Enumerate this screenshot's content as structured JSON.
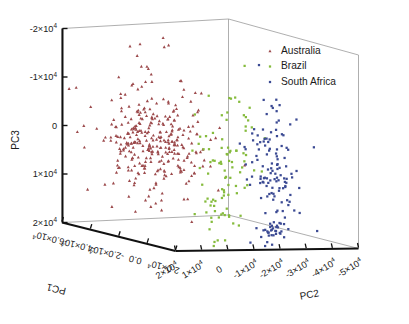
{
  "figure": {
    "kind": "3d-scatter",
    "background": "#ffffff",
    "box_line_color": "#9a9a9a",
    "axis_line_color": "#111111"
  },
  "legend": {
    "position": "top-right",
    "entries": [
      {
        "label": "Australia",
        "color": "#9c4a4c",
        "marker": "triangle"
      },
      {
        "label": "Brazil",
        "color": "#85bb3c",
        "marker": "square"
      },
      {
        "label": "South Africa",
        "color": "#3b4a93",
        "marker": "square"
      }
    ]
  },
  "axes": {
    "pc1": {
      "label": "PC1",
      "ticks": [
        "-6.0×10",
        "-4.0×10",
        "-2.0×10",
        "0.0",
        "2.0×10"
      ],
      "exponents": [
        "4",
        "4",
        "4",
        "",
        "4"
      ],
      "values": [
        -60000,
        -40000,
        -20000,
        0,
        20000
      ],
      "range": [
        -60000,
        20000
      ]
    },
    "pc2": {
      "label": "PC2",
      "ticks": [
        "2×10",
        "1×10",
        "0",
        "-1×10",
        "-2×10",
        "-3×10",
        "-4×10",
        "-5×10"
      ],
      "exponents": [
        "4",
        "4",
        "",
        "4",
        "4",
        "4",
        "4",
        "4"
      ],
      "values": [
        20000,
        10000,
        0,
        -10000,
        -20000,
        -30000,
        -40000,
        -50000
      ],
      "range": [
        20000,
        -50000
      ]
    },
    "pc3": {
      "label": "PC3",
      "ticks": [
        "-2×10",
        "-1×10",
        "0",
        "1×10",
        "2×10"
      ],
      "exponents": [
        "4",
        "4",
        "",
        "4",
        "4"
      ],
      "values": [
        -20000,
        -10000,
        0,
        10000,
        20000
      ],
      "range": [
        -20000,
        20000
      ]
    }
  },
  "chart_data": {
    "type": "scatter",
    "title": "",
    "xlabel": "PC1",
    "ylabel": "PC2",
    "zlabel": "PC3",
    "grid": false,
    "legend_position": "top-right",
    "xlim": [
      -60000,
      20000
    ],
    "ylim": [
      20000,
      -50000
    ],
    "zlim": [
      -20000,
      20000
    ],
    "series": [
      {
        "name": "Australia",
        "color": "#9c4a4c",
        "marker": "triangle",
        "n_points": 330,
        "cluster_center": [
          -25000,
          5000,
          1000
        ],
        "cluster_spread": [
          14000,
          7000,
          5000
        ],
        "note": "broad diffuse cloud on the left with sparse high outliers toward -2x10^4 on PC3"
      },
      {
        "name": "Brazil",
        "color": "#85bb3c",
        "marker": "square",
        "n_points": 95,
        "cluster_center": [
          -3000,
          -12000,
          4000
        ],
        "cluster_spread": [
          7000,
          6000,
          6000
        ],
        "note": "intermediate band bridging Australia and South Africa"
      },
      {
        "name": "South Africa",
        "color": "#3b4a93",
        "marker": "square",
        "n_points": 150,
        "cluster_center": [
          4000,
          -26000,
          5000
        ],
        "cluster_spread": [
          4000,
          4000,
          7000
        ],
        "note": "tight vertical column on the right with a dense knot near the floor"
      }
    ]
  }
}
